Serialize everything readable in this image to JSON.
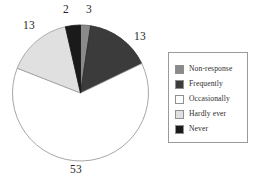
{
  "chart_data": {
    "type": "pie",
    "title": "",
    "subtitle": "",
    "xlabel": "",
    "ylabel": "",
    "grid": false,
    "legend_position": "right",
    "start_angle_deg": 0,
    "direction": "clockwise",
    "categories": [
      "Non-response",
      "Frequently",
      "Occasionally",
      "Hardly ever",
      "Never"
    ],
    "values": [
      2,
      13,
      53,
      13,
      3
    ],
    "value_labels": [
      "2",
      "13",
      "53",
      "13",
      "3"
    ],
    "colors": [
      "#8a8a8a",
      "#3b3b3b",
      "#ffffff",
      "#e0e0e0",
      "#1a1a1a"
    ],
    "slices": [
      {
        "label": "Non-response",
        "value": 2,
        "display": "2",
        "color": "#8a8a8a",
        "outline": "#5a5a5a"
      },
      {
        "label": "Frequently",
        "value": 13,
        "display": "13",
        "color": "#3b3b3b",
        "outline": "#2a2a2a"
      },
      {
        "label": "Occasionally",
        "value": 53,
        "display": "53",
        "color": "#ffffff",
        "outline": "#8f8f8f"
      },
      {
        "label": "Hardly ever",
        "value": 13,
        "display": "13",
        "color": "#e0e0e0",
        "outline": "#9a9a9a"
      },
      {
        "label": "Never",
        "value": 3,
        "display": "3",
        "color": "#1a1a1a",
        "outline": "#141414"
      }
    ]
  },
  "labels": {
    "nonresponse": "2",
    "never": "3",
    "hardly_ever": "13",
    "frequently": "13",
    "occasionally": "53"
  },
  "legend": {
    "items": [
      {
        "label": "Non-response",
        "color": "#8a8a8a"
      },
      {
        "label": "Frequently",
        "color": "#3b3b3b"
      },
      {
        "label": "Occasionally",
        "color": "#ffffff"
      },
      {
        "label": "Hardly ever",
        "color": "#e0e0e0"
      },
      {
        "label": "Never",
        "color": "#1a1a1a"
      }
    ]
  }
}
